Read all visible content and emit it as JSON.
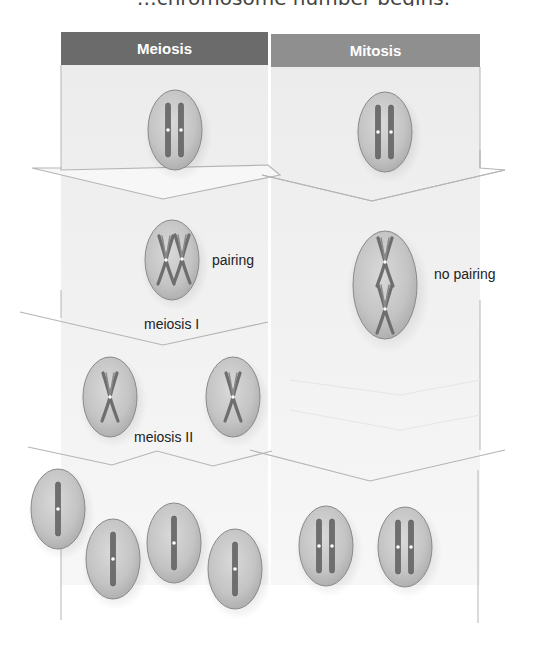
{
  "top_fragment": "…chromosome number begins.",
  "columns": {
    "meiosis": {
      "title": "Meiosis",
      "color": "#6b6b6b"
    },
    "mitosis": {
      "title": "Mitosis",
      "color": "#8f8f8f"
    }
  },
  "labels": {
    "pairing": "pairing",
    "no_pairing": "no pairing",
    "meiosis_1": "meiosis I",
    "meiosis_2": "meiosis II"
  },
  "stages": {
    "meiosis": [
      {
        "step": "parent cell",
        "cells": 1,
        "chromosomes_per_cell": 2,
        "state": "duplicated homologs, unpaired"
      },
      {
        "step": "prophase/metaphase I",
        "cells": 1,
        "chromosomes_per_cell": 2,
        "state": "homologs paired (tetrad)"
      },
      {
        "step": "after meiosis I",
        "cells": 2,
        "chromosomes_per_cell": 1,
        "state": "sister chromatids joined"
      },
      {
        "step": "after meiosis II",
        "cells": 4,
        "chromosomes_per_cell": 1,
        "state": "single chromatid"
      }
    ],
    "mitosis": [
      {
        "step": "parent cell",
        "cells": 1,
        "chromosomes_per_cell": 2,
        "state": "duplicated homologs"
      },
      {
        "step": "metaphase",
        "cells": 1,
        "chromosomes_per_cell": 2,
        "state": "aligned, no pairing"
      },
      {
        "step": "daughter cells",
        "cells": 2,
        "chromosomes_per_cell": 2,
        "state": "two chromosomes each"
      }
    ]
  },
  "colors": {
    "cell_fill": "#c9c9c9",
    "cell_edge": "#8a8a8a",
    "chromosome": "#6e6e6e",
    "arrow_fill": "#f3f3f3",
    "arrow_edge": "#b5b5b5"
  }
}
